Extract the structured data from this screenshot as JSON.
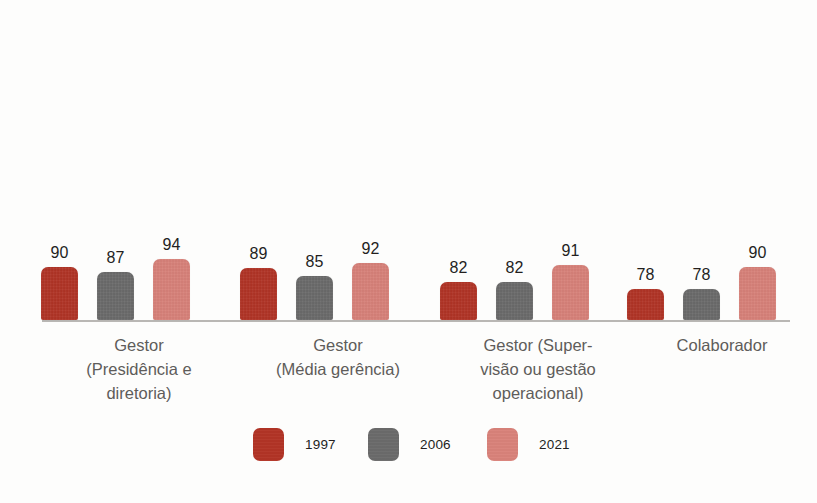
{
  "chart_data": {
    "type": "bar",
    "title": "",
    "subtitle": "",
    "xlabel": "",
    "ylabel": "",
    "grid": false,
    "legend_position": "bottom-center",
    "orientation": "vertical",
    "grouping": "grouped",
    "value_labels_shown": true,
    "axis_line_color": "#b9b7b4",
    "background_color": "#fdfdfc",
    "ylim": [
      70,
      96
    ],
    "categories": [
      "Gestor\n(Presidência e\ndiretoria)",
      "Gestor\n(Média gerência)",
      "Gestor (Super-\nvisão ou gestão\noperacional)",
      "Colaborador"
    ],
    "category_lines": [
      [
        "Gestor",
        "(Presidência e",
        "diretoria)"
      ],
      [
        "Gestor",
        "(Média gerência)"
      ],
      [
        "Gestor (Super-",
        "visão ou gestão",
        "operacional)"
      ],
      [
        "Colaborador"
      ]
    ],
    "series": [
      {
        "name": "1997",
        "color": "#b23426",
        "values": [
          90,
          89,
          82,
          78
        ]
      },
      {
        "name": "2006",
        "color": "#6b6b6b",
        "values": [
          87,
          85,
          82,
          78
        ]
      },
      {
        "name": "2021",
        "color": "#d9827a",
        "values": [
          94,
          92,
          91,
          90
        ]
      }
    ],
    "legend": [
      {
        "label": "1997",
        "color": "#b23426"
      },
      {
        "label": "2006",
        "color": "#6b6b6b"
      },
      {
        "label": "2021",
        "color": "#d9827a"
      }
    ]
  },
  "layout": {
    "baseline_y": 320,
    "axis_left": 42,
    "axis_width": 748,
    "bar_width": 37,
    "bar_gap": 19,
    "group_starts": [
      41,
      240,
      440,
      627
    ],
    "group_label_centers": [
      139,
      338,
      538,
      722
    ],
    "legend_item_lefts": [
      253,
      368,
      487
    ],
    "value_scale_px_per_unit": 1.875,
    "value_base": 70,
    "value_base_px": 16
  }
}
